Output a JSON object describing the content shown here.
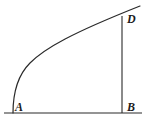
{
  "figure": {
    "name": "curve-with-right-triangle-frame",
    "background_color": "#ffffff",
    "stroke_color": "#2a2a2a",
    "stroke_width": 1.1,
    "labels": {
      "a": "A",
      "b": "B",
      "d": "D"
    },
    "points": {
      "A": {
        "x": 13,
        "y": 113
      },
      "B": {
        "x": 122,
        "y": 113
      },
      "D": {
        "x": 122,
        "y": 17
      }
    },
    "segments": [
      {
        "name": "baseline-AB",
        "x1": 4,
        "y1": 113,
        "x2": 142,
        "y2": 113
      },
      {
        "name": "vertical-DB",
        "x1": 122,
        "y1": 16,
        "x2": 122,
        "y2": 113
      }
    ],
    "curve": {
      "name": "arc-A-to-D",
      "description": "concave-down increasing curve from A rising to D, overshooting slightly past D",
      "path": "M 13 113 C 13 93, 17 76, 30 63 C 45 48, 72 33, 140 6"
    }
  }
}
